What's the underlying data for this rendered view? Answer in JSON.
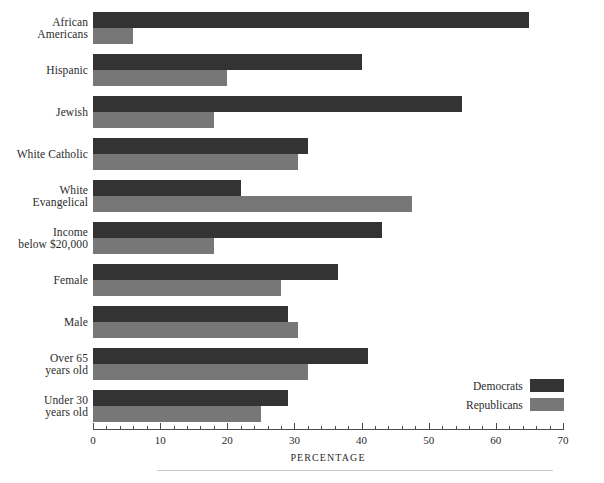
{
  "chart_data": {
    "type": "bar",
    "orientation": "horizontal",
    "title": "",
    "xlabel": "PERCENTAGE",
    "ylabel": "",
    "xlim": [
      0,
      70
    ],
    "xticks": [
      0,
      10,
      20,
      30,
      40,
      50,
      60,
      70
    ],
    "xtick_labels": [
      "0",
      "10",
      "20",
      "30",
      "40",
      "50",
      "60",
      "70"
    ],
    "minor_tick_step": 2,
    "grid": false,
    "legend_position": "lower-right",
    "categories": [
      "African Americans",
      "Hispanic",
      "Jewish",
      "White Catholic",
      "White Evangelical",
      "Income below $20,000",
      "Female",
      "Male",
      "Over 65 years old",
      "Under 30 years old"
    ],
    "category_label_lines": [
      [
        "African",
        "Americans"
      ],
      [
        "Hispanic"
      ],
      [
        "Jewish"
      ],
      [
        "White Catholic"
      ],
      [
        "White",
        "Evangelical"
      ],
      [
        "Income",
        "below $20,000"
      ],
      [
        "Female"
      ],
      [
        "Male"
      ],
      [
        "Over 65",
        "years old"
      ],
      [
        "Under 30",
        "years old"
      ]
    ],
    "series": [
      {
        "name": "Democrats",
        "color": "#333333",
        "values": [
          65,
          40,
          55,
          32,
          22,
          43,
          36.5,
          29,
          41,
          29
        ]
      },
      {
        "name": "Republicans",
        "color": "#777777",
        "values": [
          6,
          20,
          18,
          30.5,
          47.5,
          18,
          28,
          30.5,
          32,
          25
        ]
      }
    ]
  },
  "legend": {
    "items": [
      {
        "label": "Democrats",
        "color": "#333333"
      },
      {
        "label": "Republicans",
        "color": "#777777"
      }
    ]
  },
  "axis": {
    "title": "PERCENTAGE"
  },
  "colors": {
    "democrat": "#333333",
    "republican": "#777777",
    "axis": "#4a4a4a",
    "rule": "#c9c9c9",
    "text": "#2b2b2b"
  }
}
